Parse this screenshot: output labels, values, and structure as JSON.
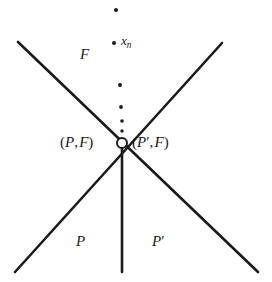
{
  "figure": {
    "type": "geometric-diagram",
    "width": 272,
    "height": 282,
    "background_color": "#ffffff",
    "stroke_color": "#1a1a1a",
    "vertex": {
      "x": 122,
      "y": 143,
      "marker": "open-circle",
      "radius": 5,
      "fill_color": "#ffffff"
    },
    "lines": [
      {
        "name": "upper-left-to-lower-right-diagonal",
        "x1": 18,
        "y1": 42,
        "x2": 258,
        "y2": 272,
        "width": 2.6
      },
      {
        "name": "upper-right-to-lower-left-diagonal",
        "x1": 222,
        "y1": 43,
        "x2": 15,
        "y2": 272,
        "width": 2.6
      },
      {
        "name": "vertical-ray-down-from-vertex",
        "x1": 122,
        "y1": 143,
        "x2": 122,
        "y2": 272,
        "width": 2.6
      }
    ],
    "dots": [
      {
        "name": "dot-1",
        "x": 116,
        "y": 10,
        "r": 2.0
      },
      {
        "name": "dot-2-xn",
        "x": 114,
        "y": 43,
        "r": 2.0
      },
      {
        "name": "dot-3",
        "x": 120,
        "y": 85,
        "r": 2.0
      },
      {
        "name": "dot-4",
        "x": 121,
        "y": 107,
        "r": 1.9
      },
      {
        "name": "dot-5",
        "x": 122,
        "y": 121,
        "r": 1.8
      },
      {
        "name": "dot-6",
        "x": 122,
        "y": 131,
        "r": 1.7
      }
    ]
  },
  "labels": {
    "region_upper": {
      "text": "F",
      "x": 80,
      "y": 47
    },
    "point_xn": {
      "base": "x",
      "sub": "n",
      "x": 121,
      "y": 34
    },
    "vertex_left": {
      "open_paren": "(",
      "first": "P",
      "comma": ",",
      "second": "F",
      "close_paren": ")",
      "x": 60,
      "y": 135
    },
    "vertex_right": {
      "open_paren": "(",
      "first": "P",
      "prime": "′",
      "comma": ",",
      "second": "F",
      "close_paren": ")",
      "x": 132,
      "y": 135
    },
    "region_lower_left": {
      "text": "P",
      "x": 76,
      "y": 234
    },
    "region_lower_right": {
      "text": "P",
      "prime": "′",
      "x": 152,
      "y": 234
    }
  }
}
